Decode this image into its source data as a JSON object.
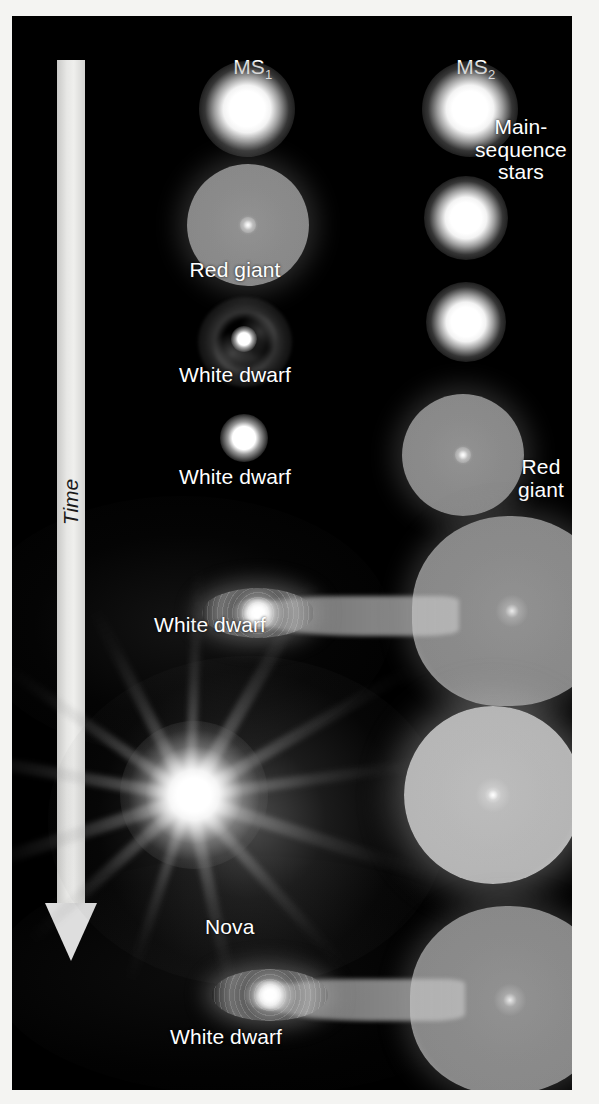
{
  "figure": {
    "background_color": "#000000",
    "page_color": "#f4f4f2",
    "label_color": "#ffffff"
  },
  "axis": {
    "time_label": "Time",
    "direction": "downward",
    "bar_color": "#e2e2e0",
    "text_color": "#1a1a1a"
  },
  "columns": {
    "left": {
      "header": "MS",
      "header_subscript": "1"
    },
    "right": {
      "header": "MS",
      "header_subscript": "2"
    }
  },
  "annotations": {
    "main_sequence_stars": "Main-\nsequence\nstars",
    "red_giant_left": "Red giant",
    "red_giant_right": "Red\ngiant",
    "white_dwarf_nebula": "White dwarf",
    "white_dwarf_alone": "White dwarf",
    "white_dwarf_accreting": "White dwarf",
    "nova": "Nova",
    "white_dwarf_final": "White dwarf"
  },
  "stages": [
    {
      "index": 1,
      "name": "main-sequence-pair",
      "left_object": "main-sequence star",
      "right_object": "main-sequence star",
      "labels": [
        "MS1",
        "MS2",
        "Main-sequence stars"
      ]
    },
    {
      "index": 2,
      "name": "primary-red-giant",
      "left_object": "red giant",
      "right_object": "main-sequence star",
      "labels": [
        "Red giant"
      ]
    },
    {
      "index": 3,
      "name": "planetary-nebula-white-dwarf",
      "left_object": "white dwarf with ejected shell",
      "right_object": "main-sequence star",
      "labels": [
        "White dwarf"
      ]
    },
    {
      "index": 4,
      "name": "secondary-evolves",
      "left_object": "white dwarf",
      "right_object": "red giant",
      "labels": [
        "White dwarf",
        "Red giant"
      ]
    },
    {
      "index": 5,
      "name": "mass-transfer",
      "left_object": "white dwarf with accretion disk",
      "right_object": "red giant overflowing Roche lobe",
      "labels": [
        "White dwarf"
      ]
    },
    {
      "index": 6,
      "name": "nova-outburst",
      "left_object": "nova explosion",
      "right_object": "illuminated red giant",
      "labels": []
    },
    {
      "index": 7,
      "name": "post-nova",
      "left_object": "white dwarf with accretion disk",
      "right_object": "red giant",
      "labels": [
        "Nova",
        "White dwarf"
      ]
    }
  ]
}
